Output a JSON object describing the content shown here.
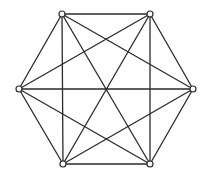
{
  "diagram": {
    "type": "complete-graph",
    "name": "K6",
    "colors": {
      "edge": "#2b2b2b",
      "vertex_fill": "#ffffff",
      "vertex_stroke": "#2b2b2b",
      "background": "#ffffff"
    },
    "vertex_radius": 3,
    "vertices": [
      {
        "id": "v1",
        "x": 62,
        "y": 14
      },
      {
        "id": "v2",
        "x": 150,
        "y": 14
      },
      {
        "id": "v3",
        "x": 193,
        "y": 89
      },
      {
        "id": "v4",
        "x": 150,
        "y": 164
      },
      {
        "id": "v5",
        "x": 63,
        "y": 164
      },
      {
        "id": "v6",
        "x": 19,
        "y": 89
      }
    ],
    "edges": [
      [
        "v1",
        "v2"
      ],
      [
        "v1",
        "v3"
      ],
      [
        "v1",
        "v4"
      ],
      [
        "v1",
        "v5"
      ],
      [
        "v1",
        "v6"
      ],
      [
        "v2",
        "v3"
      ],
      [
        "v2",
        "v4"
      ],
      [
        "v2",
        "v5"
      ],
      [
        "v2",
        "v6"
      ],
      [
        "v3",
        "v4"
      ],
      [
        "v3",
        "v5"
      ],
      [
        "v3",
        "v6"
      ],
      [
        "v4",
        "v5"
      ],
      [
        "v4",
        "v6"
      ],
      [
        "v5",
        "v6"
      ]
    ]
  }
}
